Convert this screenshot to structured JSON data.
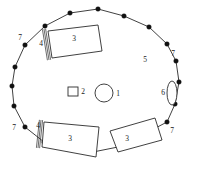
{
  "figure": {
    "kind": "site-plan-diagram",
    "stroke_color": "#2b2b2b",
    "fill_color": "#ffffff",
    "vertex_color": "#111111",
    "background": "#ffffff"
  },
  "enclosure": {
    "name": "outer-polygon-wall",
    "vertices": [
      {
        "x": 70,
        "y": 13
      },
      {
        "x": 98,
        "y": 9
      },
      {
        "x": 124,
        "y": 16
      },
      {
        "x": 149,
        "y": 27
      },
      {
        "x": 167,
        "y": 44
      },
      {
        "x": 176,
        "y": 61
      },
      {
        "x": 179,
        "y": 82
      },
      {
        "x": 175,
        "y": 104
      },
      {
        "x": 167,
        "y": 122
      },
      {
        "x": 146,
        "y": 133
      },
      {
        "x": 123,
        "y": 146
      },
      {
        "x": 93,
        "y": 152
      },
      {
        "x": 68,
        "y": 149
      },
      {
        "x": 44,
        "y": 142
      },
      {
        "x": 25,
        "y": 127
      },
      {
        "x": 14,
        "y": 106
      },
      {
        "x": 12,
        "y": 86
      },
      {
        "x": 15,
        "y": 67
      },
      {
        "x": 25,
        "y": 45
      },
      {
        "x": 45,
        "y": 26
      }
    ]
  },
  "structures": [
    {
      "name": "north-rectangle",
      "label": "3",
      "label_x": 74,
      "label_y": 39,
      "corners": [
        {
          "x": 48,
          "y": 31
        },
        {
          "x": 98,
          "y": 25
        },
        {
          "x": 102,
          "y": 51
        },
        {
          "x": 52,
          "y": 58
        }
      ]
    },
    {
      "name": "southwest-rectangle",
      "label": "3",
      "label_x": 70,
      "label_y": 139,
      "corners": [
        {
          "x": 44,
          "y": 122
        },
        {
          "x": 99,
          "y": 127
        },
        {
          "x": 96,
          "y": 157
        },
        {
          "x": 42,
          "y": 147
        }
      ]
    },
    {
      "name": "southeast-rectangle",
      "label": "3",
      "label_x": 127,
      "label_y": 139,
      "corners": [
        {
          "x": 110,
          "y": 131
        },
        {
          "x": 155,
          "y": 118
        },
        {
          "x": 162,
          "y": 140
        },
        {
          "x": 118,
          "y": 152
        }
      ]
    }
  ],
  "entrances": [
    {
      "name": "north-entrance-hatch",
      "label": "4",
      "label_x": 41,
      "label_y": 44,
      "x1": 44,
      "y1": 29,
      "x2": 49,
      "y2": 60
    },
    {
      "name": "southwest-entrance-hatch",
      "label": "4",
      "label_x": 38,
      "label_y": 126,
      "x1": 41,
      "y1": 120,
      "x2": 38,
      "y2": 148
    }
  ],
  "center_features": {
    "circle": {
      "name": "central-circle",
      "label": "1",
      "cx": 104,
      "cy": 93,
      "r": 9,
      "label_x": 118,
      "label_y": 94
    },
    "square": {
      "name": "central-square",
      "label": "2",
      "x": 68,
      "y": 87,
      "w": 10,
      "h": 9,
      "label_x": 83,
      "label_y": 92
    }
  },
  "oval_feature": {
    "name": "east-oval-feature",
    "label": "6",
    "cx": 172,
    "cy": 93,
    "rx": 5,
    "ry": 12,
    "label_x": 163,
    "label_y": 93
  },
  "interior_label": {
    "name": "interior-area-label",
    "label": "5",
    "x": 145,
    "y": 60
  },
  "corner_labels": [
    {
      "name": "corner-label-northwest",
      "label": "7",
      "x": 20,
      "y": 38
    },
    {
      "name": "corner-label-northeast",
      "label": "7",
      "x": 173,
      "y": 54
    },
    {
      "name": "corner-label-southwest",
      "label": "7",
      "x": 14,
      "y": 128
    },
    {
      "name": "corner-label-southeast",
      "label": "7",
      "x": 172,
      "y": 131
    }
  ],
  "legend_keys": {
    "1": "central circle",
    "2": "central square",
    "3": "rectangular structure",
    "4": "hatched entrance",
    "5": "enclosure interior",
    "6": "oval feature",
    "7": "corner post"
  }
}
